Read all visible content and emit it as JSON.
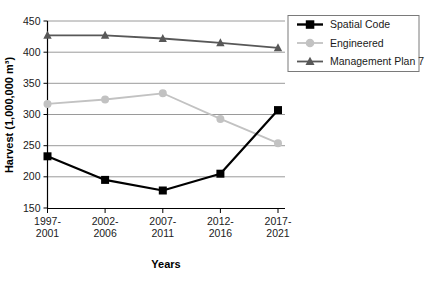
{
  "chart_data": {
    "type": "line",
    "title": "",
    "xlabel": "Years",
    "ylabel": "Harvest (1,000,000 m³)",
    "categories": [
      "1997-2001",
      "2002-2006",
      "2007-2011",
      "2012-2016",
      "2017-2021"
    ],
    "category_lines": [
      [
        "1997-",
        "2001"
      ],
      [
        "2002-",
        "2006"
      ],
      [
        "2007-",
        "2011"
      ],
      [
        "2012-",
        "2016"
      ],
      [
        "2017-",
        "2021"
      ]
    ],
    "ylim": [
      150,
      450
    ],
    "yticks": [
      150,
      200,
      250,
      300,
      350,
      400,
      450
    ],
    "ytick_labels": [
      "150",
      "200",
      "250",
      "300",
      "350",
      "400",
      "450"
    ],
    "grid": true,
    "grid_axis": "y",
    "legend_position": "top-right",
    "series": [
      {
        "name": "Spatial Code",
        "marker": "square",
        "color": "#000000",
        "values": [
          233,
          195,
          178,
          205,
          307
        ]
      },
      {
        "name": "Engineered",
        "marker": "circle",
        "color": "#c2c2c2",
        "values": [
          317,
          324,
          334,
          293,
          254
        ]
      },
      {
        "name": "Management Plan 7",
        "marker": "triangle",
        "color": "#585858",
        "values": [
          427,
          427,
          422,
          415,
          407
        ]
      }
    ]
  },
  "axis": {
    "y_title": "Harvest (1,000,000 m³)",
    "x_title": "Years"
  },
  "legend": {
    "entries": [
      {
        "label": "Spatial Code"
      },
      {
        "label": "Engineered"
      },
      {
        "label": "Management Plan 7"
      }
    ]
  },
  "colors": {
    "spatial_code": "#000000",
    "engineered": "#c2c2c2",
    "management_plan_7": "#585858",
    "grid": "#8f8f8f",
    "axis": "#000000",
    "background": "#ffffff"
  }
}
